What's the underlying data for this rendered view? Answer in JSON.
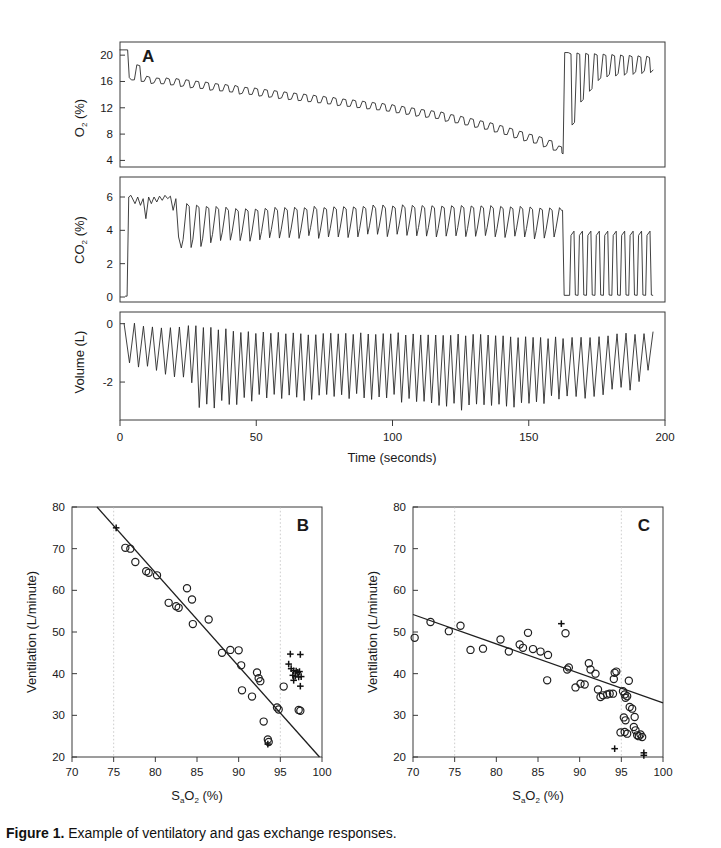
{
  "figure": {
    "caption_label": "Figure 1.",
    "caption_text": "Example of ventilatory and gas exchange responses."
  },
  "panelA": {
    "label": "A",
    "xlabel": "Time (seconds)",
    "xticks": [
      0,
      50,
      100,
      150,
      200
    ],
    "xlim": [
      0,
      200
    ],
    "subplots": [
      {
        "name": "oxygen",
        "ylabel_main": "O",
        "ylabel_sub": "2",
        "ylabel_unit": " (%)",
        "yticks": [
          4,
          8,
          12,
          16,
          20
        ],
        "ylim": [
          3,
          22
        ],
        "description": "Inspired/expired O2 percentage oscillating breath-by-breath, declining from 20% to about 5% then restored at 163 s"
      },
      {
        "name": "carbon-dioxide",
        "ylabel_main": "CO",
        "ylabel_sub": "2",
        "ylabel_unit": " (%)",
        "yticks": [
          0,
          2,
          4,
          6
        ],
        "ylim": [
          -0.3,
          7.2
        ],
        "description": "Expired CO2 percentage rising to 6% then oscillating near 4-5.5%, dropping after 163 s"
      },
      {
        "name": "volume",
        "ylabel": "Volume (L)",
        "yticks": [
          0,
          -2
        ],
        "ylim": [
          -3.3,
          0.4
        ],
        "description": "Tidal volume excursions becoming deeper and faster over the run"
      }
    ]
  },
  "chart_data": [
    {
      "type": "line",
      "title": "A",
      "xlabel": "Time (seconds)",
      "ylabel": "O2 (%)",
      "xlim": [
        0,
        200
      ],
      "ylim": [
        3,
        22
      ],
      "yticks": [
        4,
        8,
        12,
        16,
        20
      ],
      "xticks": [
        0,
        50,
        100,
        150,
        200
      ],
      "grid": false,
      "series": [
        {
          "name": "O2",
          "envelope_peaks": [
            [
              0,
              20.8
            ],
            [
              3,
              20.8
            ],
            [
              5,
              17.0
            ],
            [
              10,
              16.6
            ],
            [
              20,
              16.4
            ],
            [
              35,
              15.6
            ],
            [
              55,
              14.6
            ],
            [
              75,
              13.6
            ],
            [
              95,
              12.6
            ],
            [
              115,
              11.4
            ],
            [
              135,
              9.6
            ],
            [
              155,
              7.2
            ],
            [
              162,
              5.4
            ],
            [
              164,
              20.4
            ],
            [
              175,
              20.2
            ],
            [
              195,
              19.8
            ]
          ],
          "envelope_troughs": [
            [
              5,
              16.2
            ],
            [
              10,
              15.8
            ],
            [
              20,
              15.4
            ],
            [
              35,
              14.6
            ],
            [
              55,
              13.6
            ],
            [
              75,
              12.6
            ],
            [
              95,
              11.6
            ],
            [
              115,
              10.4
            ],
            [
              135,
              8.6
            ],
            [
              155,
              6.2
            ],
            [
              162,
              5.0
            ],
            [
              166,
              12.0
            ],
            [
              175,
              16.6
            ],
            [
              195,
              17.4
            ]
          ],
          "breath_period_s": 3.6
        }
      ]
    },
    {
      "type": "line",
      "title": "A",
      "xlabel": "Time (seconds)",
      "ylabel": "CO2 (%)",
      "xlim": [
        0,
        200
      ],
      "ylim": [
        -0.3,
        7.2
      ],
      "yticks": [
        0,
        2,
        4,
        6
      ],
      "grid": false,
      "series": [
        {
          "name": "CO2",
          "envelope_peaks": [
            [
              2,
              0.0
            ],
            [
              4,
              6.1
            ],
            [
              10,
              6.0
            ],
            [
              16,
              6.1
            ],
            [
              22,
              5.6
            ],
            [
              40,
              5.3
            ],
            [
              70,
              5.4
            ],
            [
              100,
              5.5
            ],
            [
              130,
              5.5
            ],
            [
              150,
              5.4
            ],
            [
              162,
              5.3
            ],
            [
              166,
              4.0
            ],
            [
              180,
              3.9
            ],
            [
              195,
              3.9
            ]
          ],
          "envelope_troughs": [
            [
              4,
              0.2
            ],
            [
              10,
              4.6
            ],
            [
              22,
              3.4
            ],
            [
              40,
              3.9
            ],
            [
              70,
              4.1
            ],
            [
              100,
              4.2
            ],
            [
              130,
              4.2
            ],
            [
              150,
              4.1
            ],
            [
              162,
              4.0
            ],
            [
              166,
              0.1
            ],
            [
              195,
              0.1
            ]
          ]
        }
      ]
    },
    {
      "type": "line",
      "title": "A",
      "xlabel": "Time (seconds)",
      "ylabel": "Volume (L)",
      "xlim": [
        0,
        200
      ],
      "ylim": [
        -3.3,
        0.4
      ],
      "yticks": [
        0,
        -2
      ],
      "grid": false,
      "series": [
        {
          "name": "Volume",
          "envelope_peaks": [
            [
              2,
              0.0
            ],
            [
              10,
              -0.15
            ],
            [
              25,
              -0.1
            ],
            [
              45,
              -0.3
            ],
            [
              70,
              -0.35
            ],
            [
              100,
              -0.35
            ],
            [
              130,
              -0.4
            ],
            [
              160,
              -0.5
            ],
            [
              180,
              -0.35
            ],
            [
              193,
              -0.3
            ]
          ],
          "envelope_troughs": [
            [
              5,
              -1.4
            ],
            [
              12,
              -1.6
            ],
            [
              25,
              -2.1
            ],
            [
              28,
              -2.9
            ],
            [
              50,
              -2.5
            ],
            [
              80,
              -2.5
            ],
            [
              110,
              -2.6
            ],
            [
              125,
              -2.9
            ],
            [
              150,
              -2.7
            ],
            [
              170,
              -2.4
            ],
            [
              185,
              -2.2
            ],
            [
              193,
              -1.6
            ]
          ]
        }
      ]
    },
    {
      "type": "scatter",
      "title": "B",
      "xlabel": "SaO2 (%)",
      "ylabel": "Ventilation (L/minute)",
      "xlim": [
        70,
        100
      ],
      "ylim": [
        20,
        80
      ],
      "xticks": [
        70,
        75,
        80,
        85,
        90,
        95,
        100
      ],
      "yticks": [
        20,
        30,
        40,
        50,
        60,
        70,
        80
      ],
      "gridlines_x": [
        75,
        95
      ],
      "regression": {
        "x1": 73.0,
        "y1": 80.0,
        "x2": 99.7,
        "y2": 20.0
      },
      "series": [
        {
          "name": "open-circles",
          "marker": "circle",
          "points": [
            [
              76.4,
              70.2
            ],
            [
              77.0,
              70.0
            ],
            [
              77.6,
              66.8
            ],
            [
              78.9,
              64.6
            ],
            [
              79.2,
              64.2
            ],
            [
              80.2,
              63.6
            ],
            [
              81.6,
              57.0
            ],
            [
              82.5,
              56.2
            ],
            [
              82.8,
              55.8
            ],
            [
              83.8,
              60.5
            ],
            [
              84.4,
              57.8
            ],
            [
              84.5,
              51.9
            ],
            [
              86.4,
              53.0
            ],
            [
              88.0,
              45.0
            ],
            [
              89.0,
              45.7
            ],
            [
              90.0,
              45.6
            ],
            [
              90.3,
              42.0
            ],
            [
              90.4,
              36.0
            ],
            [
              91.6,
              34.5
            ],
            [
              92.2,
              40.3
            ],
            [
              92.4,
              38.9
            ],
            [
              92.6,
              38.2
            ],
            [
              93.0,
              28.5
            ],
            [
              93.5,
              24.2
            ],
            [
              93.6,
              23.6
            ],
            [
              94.6,
              31.9
            ],
            [
              94.8,
              31.4
            ],
            [
              95.4,
              36.9
            ],
            [
              97.2,
              31.3
            ],
            [
              97.4,
              31.1
            ]
          ]
        },
        {
          "name": "plus-markers",
          "marker": "plus",
          "points": [
            [
              75.3,
              75.0
            ],
            [
              96.2,
              44.7
            ],
            [
              97.4,
              44.6
            ],
            [
              96.0,
              42.3
            ],
            [
              96.3,
              41.2
            ],
            [
              96.6,
              40.7
            ],
            [
              96.9,
              40.6
            ],
            [
              97.1,
              40.3
            ],
            [
              97.3,
              40.5
            ],
            [
              96.5,
              39.6
            ],
            [
              96.8,
              39.4
            ],
            [
              97.2,
              39.2
            ],
            [
              97.5,
              39.3
            ],
            [
              96.6,
              38.4
            ],
            [
              97.4,
              37.0
            ],
            [
              93.5,
              23.1
            ]
          ]
        }
      ]
    },
    {
      "type": "scatter",
      "title": "C",
      "xlabel": "SaO2 (%)",
      "ylabel": "Ventilation (L/minute)",
      "xlim": [
        70,
        100
      ],
      "ylim": [
        20,
        80
      ],
      "xticks": [
        70,
        75,
        80,
        85,
        90,
        95,
        100
      ],
      "yticks": [
        20,
        30,
        40,
        50,
        60,
        70,
        80
      ],
      "gridlines_x": [
        75,
        95
      ],
      "regression": {
        "x1": 70.0,
        "y1": 54.2,
        "x2": 100.0,
        "y2": 33.0
      },
      "series": [
        {
          "name": "open-circles",
          "marker": "circle",
          "points": [
            [
              70.2,
              48.6
            ],
            [
              72.1,
              52.4
            ],
            [
              74.3,
              50.2
            ],
            [
              75.7,
              51.5
            ],
            [
              76.9,
              45.7
            ],
            [
              78.4,
              46.0
            ],
            [
              80.5,
              48.2
            ],
            [
              81.5,
              45.3
            ],
            [
              82.8,
              47.0
            ],
            [
              83.2,
              46.2
            ],
            [
              83.8,
              49.8
            ],
            [
              84.4,
              45.9
            ],
            [
              85.3,
              45.3
            ],
            [
              86.1,
              38.4
            ],
            [
              86.2,
              44.5
            ],
            [
              88.3,
              49.7
            ],
            [
              88.5,
              41.0
            ],
            [
              88.7,
              41.5
            ],
            [
              89.5,
              36.7
            ],
            [
              90.1,
              37.6
            ],
            [
              90.6,
              37.4
            ],
            [
              91.1,
              42.5
            ],
            [
              91.3,
              41.0
            ],
            [
              91.9,
              40.0
            ],
            [
              92.2,
              36.2
            ],
            [
              92.5,
              34.4
            ],
            [
              92.8,
              34.8
            ],
            [
              93.3,
              35.0
            ],
            [
              93.6,
              35.2
            ],
            [
              94.0,
              35.2
            ],
            [
              94.2,
              40.2
            ],
            [
              94.4,
              40.5
            ],
            [
              94.1,
              38.7
            ],
            [
              95.2,
              35.8
            ],
            [
              95.4,
              35.0
            ],
            [
              95.5,
              34.2
            ],
            [
              95.7,
              34.6
            ],
            [
              95.9,
              38.3
            ],
            [
              95.3,
              29.5
            ],
            [
              95.5,
              28.8
            ],
            [
              95.4,
              26.0
            ],
            [
              95.7,
              25.6
            ],
            [
              96.3,
              31.6
            ],
            [
              96.6,
              29.6
            ],
            [
              96.5,
              27.2
            ],
            [
              96.7,
              26.4
            ],
            [
              96.9,
              25.2
            ],
            [
              97.1,
              25.0
            ],
            [
              97.3,
              25.4
            ],
            [
              97.5,
              24.8
            ],
            [
              96.0,
              32.0
            ],
            [
              94.9,
              25.9
            ]
          ]
        },
        {
          "name": "plus-markers",
          "marker": "plus",
          "points": [
            [
              87.8,
              52.0
            ],
            [
              94.2,
              22.0
            ],
            [
              97.7,
              21.0
            ],
            [
              97.7,
              20.4
            ]
          ]
        }
      ]
    }
  ],
  "panelB": {
    "label": "B",
    "xlabel_main": "S",
    "xlabel_sub_a": "a",
    "xlabel_o": "O",
    "xlabel_sub_2": "2",
    "xlabel_unit": " (%)",
    "ylabel": "Ventilation (L/minute)",
    "xticks": [
      70,
      75,
      80,
      85,
      90,
      95,
      100
    ],
    "yticks": [
      20,
      30,
      40,
      50,
      60,
      70,
      80
    ]
  },
  "panelC": {
    "label": "C",
    "xlabel_main": "S",
    "xlabel_sub_a": "a",
    "xlabel_o": "O",
    "xlabel_sub_2": "2",
    "xlabel_unit": " (%)",
    "ylabel": "Ventilation (L/minute)",
    "xticks": [
      70,
      75,
      80,
      85,
      90,
      95,
      100
    ],
    "yticks": [
      20,
      30,
      40,
      50,
      60,
      70,
      80
    ]
  },
  "colors": {
    "trace": "#2b2b2b",
    "axis": "#3a3a3a",
    "grid": "#b9b9b9",
    "marker": "#1f1f1f"
  }
}
